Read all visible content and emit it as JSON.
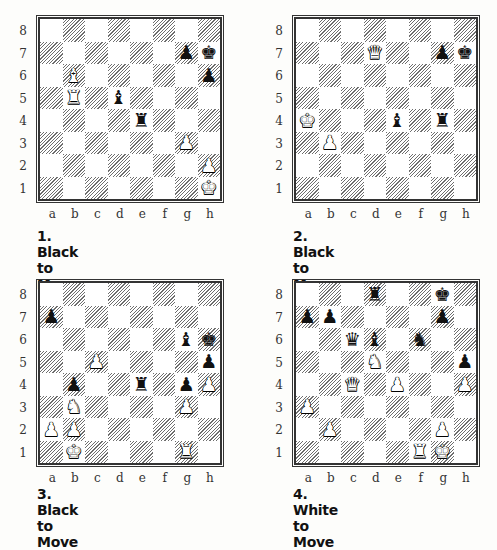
{
  "files": [
    "a",
    "b",
    "c",
    "d",
    "e",
    "f",
    "g",
    "h"
  ],
  "ranks": [
    "8",
    "7",
    "6",
    "5",
    "4",
    "3",
    "2",
    "1"
  ],
  "diagrams": [
    {
      "caption": "1. Black to Move",
      "to_move": "black",
      "pieces": {
        "g7": "bP",
        "h7": "bK",
        "b6": "wB",
        "h6": "bP",
        "b5": "wR",
        "d5": "bB",
        "e4": "bR",
        "g3": "wP",
        "h2": "wP",
        "h1": "wK"
      }
    },
    {
      "caption": "2. Black to Move",
      "to_move": "black",
      "pieces": {
        "d7": "wQ",
        "g7": "bP",
        "h7": "bK",
        "a4": "wK",
        "e4": "bB",
        "g4": "bR",
        "b3": "wP"
      }
    },
    {
      "caption": "3. Black to Move",
      "to_move": "black",
      "pieces": {
        "a7": "bP",
        "g6": "bB",
        "h6": "bK",
        "c5": "wP",
        "h5": "bP",
        "b4": "bP",
        "e4": "bR",
        "g4": "bP",
        "h4": "wP",
        "b3": "wN",
        "g3": "wP",
        "a2": "wP",
        "b2": "wP",
        "b1": "wK",
        "g1": "wR"
      }
    },
    {
      "caption": "4. White to Move",
      "to_move": "white",
      "pieces": {
        "d8": "bR",
        "g8": "bK",
        "a7": "bP",
        "b7": "bP",
        "g7": "bP",
        "c6": "bQ",
        "d6": "bB",
        "f6": "bN",
        "d5": "wN",
        "h5": "bP",
        "c4": "wQ",
        "e4": "wP",
        "h4": "wP",
        "a3": "wP",
        "b2": "wP",
        "g2": "wP",
        "f1": "wR",
        "g1": "wK"
      }
    }
  ],
  "glyphs": {
    "K": "♚",
    "Q": "♛",
    "R": "♜",
    "B": "♝",
    "N": "♞",
    "P": "♟"
  }
}
